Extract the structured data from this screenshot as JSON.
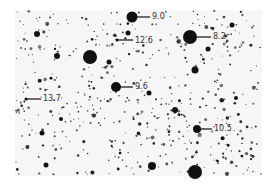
{
  "figure": {
    "type": "negative star field photograph",
    "background": "#f6f6f6",
    "star_color": "#111111"
  },
  "labeled_stars": [
    {
      "magnitude": "9.0",
      "star_x": 132,
      "star_y": 17,
      "r": 5.5,
      "pointer_x2": 150,
      "label_x": 152,
      "label_y": 13
    },
    {
      "magnitude": "12.6",
      "star_x": 117,
      "star_y": 40,
      "r": 1.5,
      "pointer_x2": 133,
      "label_x": 135,
      "label_y": 37
    },
    {
      "magnitude": "8.2",
      "star_x": 190,
      "star_y": 37,
      "r": 7,
      "pointer_x2": 211,
      "label_x": 213,
      "label_y": 33
    },
    {
      "magnitude": "13.7",
      "star_x": 26,
      "star_y": 99,
      "r": 1.5,
      "pointer_x2": 41,
      "label_x": 43,
      "label_y": 95
    },
    {
      "magnitude": "9.6",
      "star_x": 116,
      "star_y": 87,
      "r": 5,
      "pointer_x2": 133,
      "label_x": 135,
      "label_y": 83
    },
    {
      "magnitude": "10.5",
      "star_x": 197,
      "star_y": 129,
      "r": 4,
      "pointer_x2": 212,
      "label_x": 214,
      "label_y": 125
    }
  ],
  "other_bright_stars": [
    {
      "x": 90,
      "y": 57,
      "r": 7
    },
    {
      "x": 195,
      "y": 172,
      "r": 7
    },
    {
      "x": 152,
      "y": 166,
      "r": 4
    },
    {
      "x": 195,
      "y": 70,
      "r": 3.5
    },
    {
      "x": 57,
      "y": 56,
      "r": 3
    },
    {
      "x": 37,
      "y": 34,
      "r": 3
    },
    {
      "x": 175,
      "y": 110,
      "r": 3
    },
    {
      "x": 46,
      "y": 165,
      "r": 2.5
    },
    {
      "x": 109,
      "y": 62,
      "r": 2.5
    },
    {
      "x": 128,
      "y": 33,
      "r": 2.5
    },
    {
      "x": 42,
      "y": 133,
      "r": 2.5
    },
    {
      "x": 232,
      "y": 25,
      "r": 2.5
    },
    {
      "x": 208,
      "y": 49,
      "r": 2.5
    },
    {
      "x": 149,
      "y": 93,
      "r": 2.5
    },
    {
      "x": 61,
      "y": 119,
      "r": 2
    },
    {
      "x": 236,
      "y": 98,
      "r": 2
    }
  ]
}
